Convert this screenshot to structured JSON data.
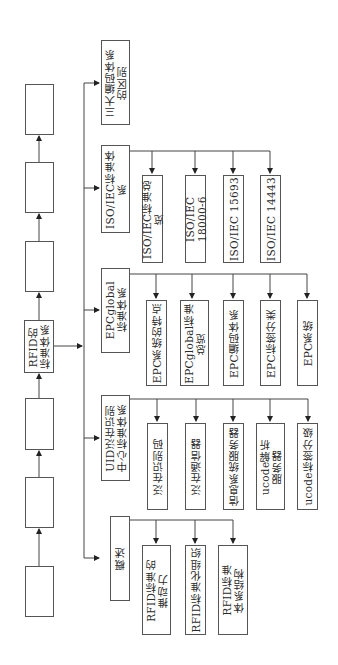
{
  "diagram": {
    "root": {
      "label": "RFID的\n标准体系"
    },
    "chain_boxes": [
      {
        "label": ""
      },
      {
        "label": ""
      },
      {
        "label": ""
      },
      {
        "label": ""
      },
      {
        "label": ""
      },
      {
        "label": ""
      }
    ],
    "categories": [
      {
        "label": "三大编码体系\n的区别",
        "children": []
      },
      {
        "label": "ISO/IEC标准体系",
        "children": [
          {
            "label": "ISO/IEC标准总览"
          },
          {
            "label": "ISO/IEC 18000-6"
          },
          {
            "label": "ISO/IEC 15693"
          },
          {
            "label": "ISO/IEC 14443"
          }
        ]
      },
      {
        "label": "EPCglobal\n标准体系",
        "children": [
          {
            "label": "EPC系统的特点"
          },
          {
            "label": "EPCglobal标准\n总览"
          },
          {
            "label": "EPC编码体系"
          },
          {
            "label": "EPC标签分类"
          },
          {
            "label": "EPC系统"
          }
        ]
      },
      {
        "label": "UID泛在识别\n中心标准体系",
        "children": [
          {
            "label": "泛在识别码"
          },
          {
            "label": "泛在通信器"
          },
          {
            "label": "信息系统服务器"
          },
          {
            "label": "ucode解析\n服务器"
          },
          {
            "label": "ucode标签分级"
          }
        ]
      },
      {
        "label": "概述",
        "children": [
          {
            "label": "RFID标准的\n推动力"
          },
          {
            "label": "RFID标准化组织"
          },
          {
            "label": "RFID标准\n体系结构"
          }
        ]
      }
    ]
  }
}
